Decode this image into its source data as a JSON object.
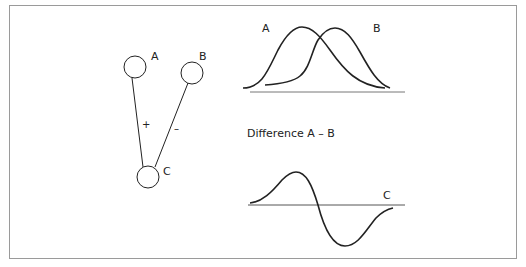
{
  "network": {
    "nodes": [
      {
        "id": "A",
        "label": "A"
      },
      {
        "id": "B",
        "label": "B"
      },
      {
        "id": "C",
        "label": "C"
      }
    ],
    "edges": [
      {
        "from": "A",
        "to": "C",
        "sign": "+"
      },
      {
        "from": "B",
        "to": "C",
        "sign": "–"
      }
    ]
  },
  "top_graph": {
    "curve_a_label": "A",
    "curve_b_label": "B"
  },
  "bottom_graph": {
    "title": "Difference A – B",
    "curve_label": "C"
  },
  "colors": {
    "stroke": "#222222",
    "frame": "#9a9a9a",
    "background": "#ffffff"
  }
}
